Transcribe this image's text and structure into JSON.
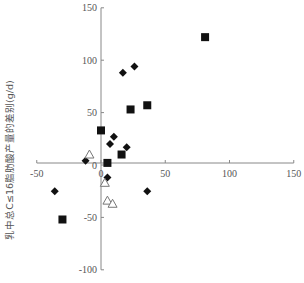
{
  "chart_data": {
    "type": "scatter",
    "title": "",
    "xlabel": "",
    "ylabel": "乳中总C≤16脂肪酸产量的差别(g/d)",
    "xlim": [
      -50,
      150
    ],
    "ylim": [
      -100,
      150
    ],
    "x_ticks": [
      -50,
      0,
      50,
      100,
      150
    ],
    "y_ticks": [
      -100,
      -50,
      0,
      50,
      100,
      150
    ],
    "grid": false,
    "legend": null,
    "series": [
      {
        "name": "filled-square",
        "marker": "square",
        "color": "#111111",
        "points": [
          {
            "x": 81,
            "y": 122
          },
          {
            "x": 23,
            "y": 53
          },
          {
            "x": 36,
            "y": 57
          },
          {
            "x": 0,
            "y": 33
          },
          {
            "x": 16,
            "y": 10
          },
          {
            "x": 5,
            "y": 2
          },
          {
            "x": -30,
            "y": -52
          }
        ]
      },
      {
        "name": "filled-diamond",
        "marker": "diamond",
        "color": "#111111",
        "points": [
          {
            "x": 17,
            "y": 88
          },
          {
            "x": 26,
            "y": 94
          },
          {
            "x": 10,
            "y": 27
          },
          {
            "x": 7,
            "y": 20
          },
          {
            "x": 20,
            "y": 17
          },
          {
            "x": -12,
            "y": 4
          },
          {
            "x": 5,
            "y": -12
          },
          {
            "x": -36,
            "y": -25
          },
          {
            "x": 36,
            "y": -25
          }
        ]
      },
      {
        "name": "open-triangle",
        "marker": "triangle-open",
        "color": "#777777",
        "points": [
          {
            "x": -9,
            "y": 10
          },
          {
            "x": 3,
            "y": -17
          },
          {
            "x": 5,
            "y": -34
          },
          {
            "x": 9,
            "y": -37
          }
        ]
      }
    ]
  },
  "layout": {
    "plot_px": {
      "x0": 101,
      "y0": 165,
      "px_per_x": 1.285,
      "px_per_y": 1.048,
      "xaxis_y": 163,
      "yaxis_x": 101
    }
  }
}
